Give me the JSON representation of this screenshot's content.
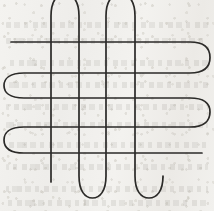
{
  "figure": {
    "medium": "hand-drawn ink line on aged off-white paper",
    "canvas": {
      "width": 214,
      "height": 211
    },
    "colors": {
      "paper": "#f1f0ec",
      "paper_shadow": "#eceae6",
      "ink": "#2b2a28",
      "ghost_text": "#78746c",
      "page_background": "#ffffff"
    },
    "stroke": {
      "width": 1.7,
      "linecap": "round",
      "linejoin": "round"
    }
  },
  "geometry": {
    "horizontal_curve": {
      "name": "horizontal-serpentine",
      "pass_count": 4,
      "turn_count": 3,
      "pass_y_values": [
        42,
        73,
        108,
        153
      ],
      "return_y_values": [
        73,
        92,
        128,
        153
      ],
      "left_margin_x": 8,
      "right_margin_x": 206,
      "start_point": [
        11,
        42
      ],
      "end_point": [
        202,
        153
      ],
      "turn_sides": [
        "right",
        "left",
        "right"
      ],
      "path": "M 11 42 L 190 42 C 205 42 210 49 210 57.5 C 210 66 205 73 190 73 L 24 73 C 9 73 4 79 4 85.5 C 4 92 9 98 24 98 L 190 98 C 205 98 210 104 210 112 C 210 120 205 127 190 127 L 24 127 C 9 127 4 133 4 140 C 4 147 9 153 24 153 L 202 153"
    },
    "vertical_curve": {
      "name": "vertical-serpentine",
      "pass_count": 5,
      "turn_count": 4,
      "pass_x_values": [
        51,
        79,
        106,
        135,
        163
      ],
      "top_margin_y": -12,
      "bottom_margin_y": 200,
      "start_point": [
        51,
        182
      ],
      "end_point": [
        163,
        178
      ],
      "turn_sides": [
        "top",
        "bottom",
        "top",
        "bottom"
      ],
      "path": "M 51 182 L 51 16 C 51 1 57 -6 65 -6 C 73 -6 79 1 79 16 L 79 176 C 79 191 85 198 92.5 198 C 100 198 106 191 106 176 L 106 16 C 106 1 112 -6 120.5 -6 C 129 -6 135 1 135 16 L 135 176 C 135 191 141 198 149 198 C 157 198 163 191 163 176 L 163 178"
    },
    "intersections": {
      "count": 20,
      "description": "Each of the 5 vertical passes crosses each of the 4 horizontal passes, creating a 5 x 4 lattice of crossings."
    }
  },
  "ghost_text": {
    "visible": true,
    "legible": false,
    "note": "Faint show-through text bleeding from the reverse side of the page; illegible at this scale.",
    "line_positions_y": [
      22,
      38,
      60,
      82,
      104,
      122,
      142,
      164,
      186,
      200
    ]
  }
}
